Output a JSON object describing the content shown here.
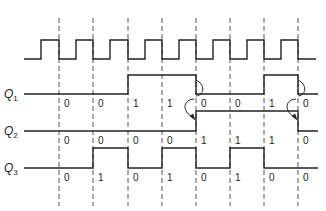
{
  "diagram": {
    "type": "timing-diagram",
    "clock": {
      "name": "clock",
      "initial_level": 0,
      "periods": 8,
      "description": "square wave, falling edges aligned to dashed lines"
    },
    "signals": [
      {
        "name": "Q",
        "subscript": "1",
        "initial": 0,
        "values": [
          "0",
          "0",
          "1",
          "1",
          "0",
          "0",
          "1",
          "0"
        ]
      },
      {
        "name": "Q",
        "subscript": "2",
        "initial": 0,
        "values": [
          "0",
          "0",
          "0",
          "0",
          "1",
          "1",
          "1",
          "0"
        ]
      },
      {
        "name": "Q",
        "subscript": "3",
        "initial": 0,
        "values": [
          "0",
          "1",
          "0",
          "1",
          "0",
          "1",
          "0",
          "0"
        ]
      }
    ],
    "annotations": [
      {
        "type": "curved-arrow",
        "from": "Q1 falling edge",
        "to": "Q2 rising edge",
        "at_column": 4
      },
      {
        "type": "curved-arrow",
        "from": "Q1 falling edge",
        "to": "Q2 falling edge",
        "at_column": 7
      }
    ],
    "colors": {
      "line": "#222222",
      "dash": "#444444",
      "background": "#ffffff"
    }
  }
}
